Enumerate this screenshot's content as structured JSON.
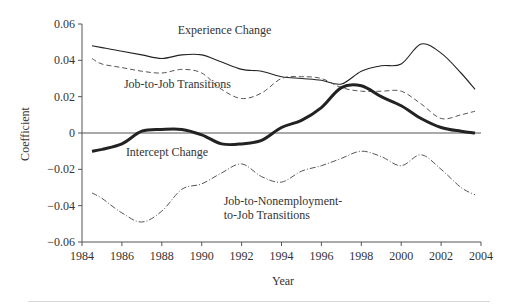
{
  "chart_data": {
    "type": "line",
    "title": "",
    "xlabel": "Year",
    "ylabel": "Coefficient",
    "xlim": [
      1984,
      2004
    ],
    "ylim": [
      -0.06,
      0.06
    ],
    "grid": false,
    "legend": "inline annotations",
    "x_ticks": [
      1984,
      1986,
      1988,
      1990,
      1992,
      1994,
      1996,
      1998,
      2000,
      2002,
      2004
    ],
    "x_tick_labels": [
      "1984",
      "1986",
      "1988",
      "1990",
      "1992",
      "1994",
      "1996",
      "1998",
      "2000",
      "2002",
      "2004"
    ],
    "y_ticks": [
      0.06,
      0.04,
      0.02,
      0,
      -0.02,
      -0.04,
      -0.06
    ],
    "y_tick_labels": [
      "0.06",
      "0.04",
      "0.02",
      "0",
      "−0.02",
      "−0.04",
      "−0.06"
    ],
    "zero_line": true,
    "x": [
      1984.5,
      1985,
      1986,
      1987,
      1988,
      1989,
      1990,
      1991,
      1992,
      1993,
      1994,
      1995,
      1996,
      1997,
      1998,
      1999,
      2000,
      2001,
      2002,
      2003,
      2003.7
    ],
    "series": [
      {
        "name": "Experience Change",
        "style": "solid-thin",
        "values": [
          0.048,
          0.047,
          0.045,
          0.043,
          0.041,
          0.043,
          0.043,
          0.039,
          0.035,
          0.034,
          0.031,
          0.03,
          0.029,
          0.027,
          0.034,
          0.037,
          0.038,
          0.049,
          0.044,
          0.033,
          0.024
        ]
      },
      {
        "name": "Job-to-Job Transitions",
        "style": "dashed",
        "values": [
          0.041,
          0.038,
          0.036,
          0.034,
          0.033,
          0.035,
          0.033,
          0.024,
          0.019,
          0.022,
          0.03,
          0.031,
          0.03,
          0.025,
          0.023,
          0.023,
          0.023,
          0.016,
          0.008,
          0.01,
          0.012
        ]
      },
      {
        "name": "Intercept Change",
        "style": "solid-thick",
        "values": [
          -0.01,
          -0.009,
          -0.006,
          0.001,
          0.002,
          0.002,
          -0.001,
          -0.006,
          -0.006,
          -0.004,
          0.003,
          0.007,
          0.014,
          0.025,
          0.026,
          0.02,
          0.015,
          0.008,
          0.003,
          0.001,
          0.0
        ]
      },
      {
        "name": "Job-to-Nonemployment-to-Job Transitions",
        "style": "dash-dot",
        "values": [
          -0.033,
          -0.036,
          -0.044,
          -0.049,
          -0.043,
          -0.031,
          -0.028,
          -0.022,
          -0.017,
          -0.024,
          -0.027,
          -0.021,
          -0.018,
          -0.014,
          -0.01,
          -0.013,
          -0.018,
          -0.012,
          -0.02,
          -0.03,
          -0.034
        ]
      }
    ],
    "annotations": [
      {
        "text": "Experience Change",
        "x": 1988.8,
        "y": 0.0545
      },
      {
        "text": "Job-to-Job Transitions",
        "x": 1986.1,
        "y": 0.0245
      },
      {
        "text": "Intercept Change",
        "x": 1986.2,
        "y": -0.0125
      },
      {
        "text": "Job-to-Nonemployment-",
        "x": 1991.1,
        "y": -0.0395
      },
      {
        "text": "to-Job Transitions",
        "x": 1991.1,
        "y": -0.0475
      }
    ]
  },
  "layout": {
    "plot_left": 82,
    "plot_right": 481,
    "plot_top": 24,
    "plot_bottom": 242
  },
  "colors": {
    "axis": "#555555",
    "line": "#222222",
    "text": "#333333"
  }
}
